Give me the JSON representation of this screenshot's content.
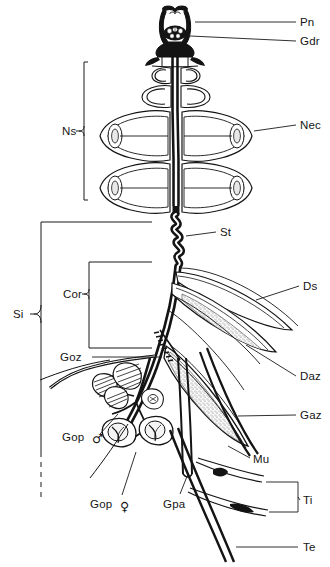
{
  "figure": {
    "background_color": "#ffffff",
    "ink_color": "#1a1a1a",
    "stipple_color": "#6e6e6e"
  },
  "labels": {
    "pn": {
      "text": "Pn",
      "x": 300,
      "y": 26,
      "anchor": "start"
    },
    "gdr": {
      "text": "Gdr",
      "x": 300,
      "y": 45,
      "anchor": "start"
    },
    "nec": {
      "text": "Nec",
      "x": 300,
      "y": 129,
      "anchor": "start"
    },
    "ns": {
      "text": "Ns",
      "x": 62,
      "y": 131,
      "anchor": "start"
    },
    "st": {
      "text": "St",
      "x": 220,
      "y": 236,
      "anchor": "start"
    },
    "ds": {
      "text": "Ds",
      "x": 303,
      "y": 290,
      "anchor": "start"
    },
    "daz": {
      "text": "Daz",
      "x": 300,
      "y": 380,
      "anchor": "start"
    },
    "gaz": {
      "text": "Gaz",
      "x": 300,
      "y": 419,
      "anchor": "start"
    },
    "si": {
      "text": "Si",
      "x": 13,
      "y": 318,
      "anchor": "start"
    },
    "cor": {
      "text": "Cor",
      "x": 63,
      "y": 294,
      "anchor": "start"
    },
    "goz": {
      "text": "Goz",
      "x": 60,
      "y": 357,
      "anchor": "start"
    },
    "gop_male": {
      "text": "Gop",
      "symbol": "♂",
      "x": 62,
      "y": 441,
      "anchor": "start"
    },
    "gop_female": {
      "text": "Gop",
      "symbol": "♀",
      "x": 90,
      "y": 508,
      "anchor": "start"
    },
    "gpa": {
      "text": "Gpa",
      "x": 163,
      "y": 508,
      "anchor": "start"
    },
    "mu": {
      "text": "Mu",
      "x": 253,
      "y": 463,
      "anchor": "start"
    },
    "ti": {
      "text": "Ti",
      "x": 303,
      "y": 504,
      "anchor": "start"
    },
    "te": {
      "text": "Te",
      "x": 303,
      "y": 551,
      "anchor": "start"
    }
  },
  "label_order": [
    "pn",
    "gdr",
    "nec",
    "ns",
    "st",
    "ds",
    "daz",
    "gaz",
    "si",
    "cor",
    "goz",
    "gop_male",
    "gop_female",
    "gpa",
    "mu",
    "ti",
    "te"
  ]
}
